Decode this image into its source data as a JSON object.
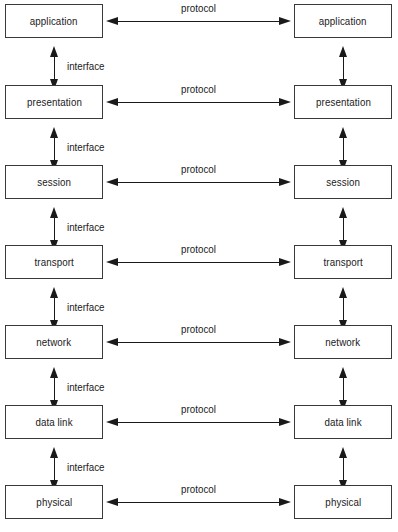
{
  "diagram": {
    "type": "layered-protocol-stack",
    "colors": {
      "background": "#ffffff",
      "line": "#1a1a1a",
      "box_border": "#3a3a3a",
      "text": "#1a1a1a"
    },
    "columns": [
      {
        "side": "left",
        "name": "host-1"
      },
      {
        "side": "right",
        "name": "host-2"
      }
    ],
    "horizontal_connector_label": "protocol",
    "vertical_connector_label": "interface",
    "layers": [
      {
        "index": 7,
        "left_label": "application",
        "right_label": "application",
        "protocol_label": "protocol",
        "interface_label": "interface"
      },
      {
        "index": 6,
        "left_label": "presentation",
        "right_label": "presentation",
        "protocol_label": "protocol",
        "interface_label": "interface"
      },
      {
        "index": 5,
        "left_label": "session",
        "right_label": "session",
        "protocol_label": "protocol",
        "interface_label": "interface"
      },
      {
        "index": 4,
        "left_label": "transport",
        "right_label": "transport",
        "protocol_label": "protocol",
        "interface_label": "interface"
      },
      {
        "index": 3,
        "left_label": "network",
        "right_label": "network",
        "protocol_label": "protocol",
        "interface_label": "interface"
      },
      {
        "index": 2,
        "left_label": "data link",
        "right_label": "data link",
        "protocol_label": "protocol",
        "interface_label": "interface"
      },
      {
        "index": 1,
        "left_label": "physical",
        "right_label": "physical",
        "protocol_label": "protocol",
        "interface_label": null
      }
    ]
  }
}
